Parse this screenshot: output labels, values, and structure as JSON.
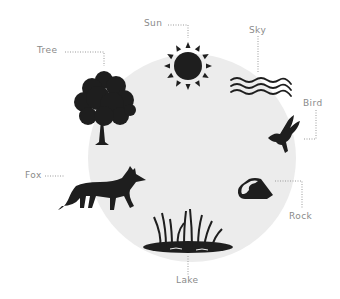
{
  "diagram": {
    "type": "nature-elements-circle",
    "background_circle_color": "#ececec",
    "icon_color": "#1e1e1e",
    "label_color": "#8a8a8a",
    "leader_line_style": "dotted",
    "elements": [
      {
        "id": "sun",
        "label": "Sun",
        "icon": "sun-icon"
      },
      {
        "id": "sky",
        "label": "Sky",
        "icon": "wavy-lines-icon"
      },
      {
        "id": "bird",
        "label": "Bird",
        "icon": "bird-icon"
      },
      {
        "id": "rock",
        "label": "Rock",
        "icon": "rock-icon"
      },
      {
        "id": "lake",
        "label": "Lake",
        "icon": "lake-reeds-icon"
      },
      {
        "id": "fox",
        "label": "Fox",
        "icon": "fox-icon"
      },
      {
        "id": "tree",
        "label": "Tree",
        "icon": "tree-icon"
      }
    ]
  }
}
